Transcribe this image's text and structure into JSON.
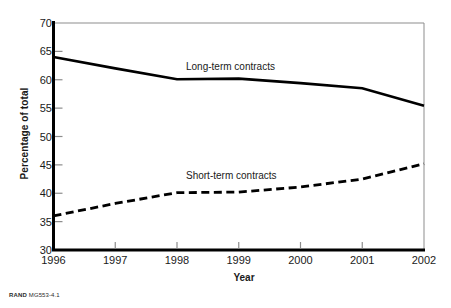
{
  "chart_data": {
    "type": "line",
    "title": "",
    "xlabel": "Year",
    "ylabel": "Percentage of total",
    "x": [
      1996,
      1997,
      1998,
      1999,
      2000,
      2001,
      2002
    ],
    "xticklabels": [
      "1996",
      "1997",
      "1998",
      "1999",
      "2000",
      "2001",
      "2002"
    ],
    "yticks": [
      30,
      35,
      40,
      45,
      50,
      55,
      60,
      65,
      70
    ],
    "yticklabels": [
      "30",
      "35",
      "40",
      "45",
      "50",
      "55",
      "60",
      "65",
      "70"
    ],
    "xlim": [
      1996,
      2002
    ],
    "ylim": [
      30,
      70
    ],
    "grid": false,
    "legend": "inline-annotations",
    "series": [
      {
        "name": "Long-term contracts",
        "style": "solid",
        "color": "#000000",
        "values": [
          64.0,
          62.0,
          60.1,
          60.2,
          59.4,
          58.5,
          55.4
        ]
      },
      {
        "name": "Short-term contracts",
        "style": "dashed",
        "color": "#000000",
        "values": [
          36.0,
          38.2,
          40.1,
          40.2,
          41.1,
          42.5,
          45.2
        ]
      }
    ],
    "annotations": [
      {
        "text": "Long-term contracts",
        "series": "Long-term contracts"
      },
      {
        "text": "Short-term contracts",
        "series": "Short-term contracts"
      }
    ]
  },
  "footer": {
    "mark": "RAND",
    "id": "MG553-4.1"
  }
}
